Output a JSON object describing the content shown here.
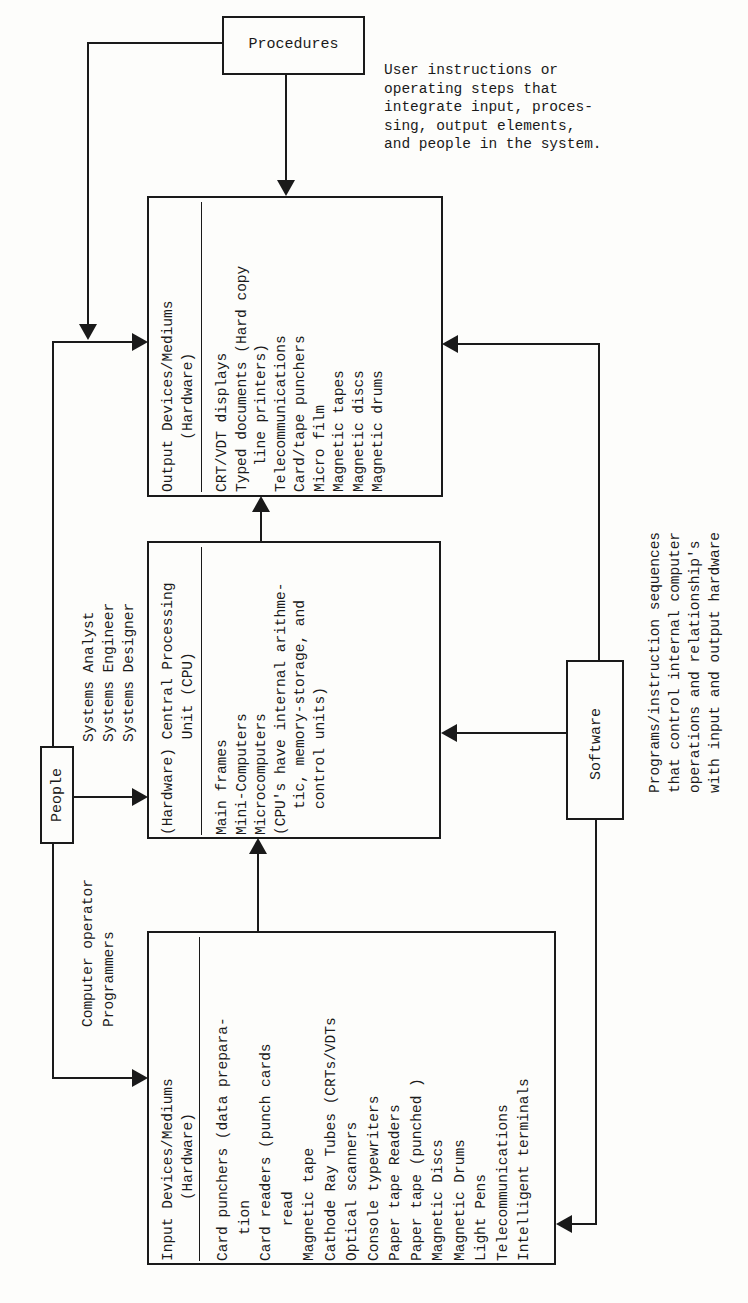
{
  "procedures": {
    "label": "Procedures",
    "description": "User instructions or\noperating steps that\nintegrate input, proces-\nsing, output elements,\nand people in the system."
  },
  "output_box": {
    "title": "Output Devices/Mediums\n      (Hardware)",
    "items": "CRT/VDT displays\nTyped documents (Hard copy\n   line printers)\nTelecommunications\nCard/tape punchers\nMicro film\nMagnetic tapes\nMagnetic discs\nMagnetic drums"
  },
  "cpu_box": {
    "title": "(Hardware) Central Processing\n           Unit (CPU)",
    "items": "Main frames\nMini-Computers\nMicrocomputers\n(CPU's have internal arithme-\n   tic, memory-storage, and\n   control units)"
  },
  "input_box": {
    "title": "Input Devices/Mediums\n       (Hardware)",
    "items": "Card punchers (data prepara-\n   tion\nCard readers (punch cards\n    read\nMagnetic tape\nCathode Ray Tubes (CRTs/VDTs\nOptical scanners\nConsole typewriters\nPaper tape Readers\nPaper tape (punched )\nMagnetic Discs\nMagnetic Drums\nLight Pens\nTelecommunications\nIntelligent terminals"
  },
  "people": {
    "label": "People",
    "upper_roles": "Systems Analyst\nSystems Engineer\nSystems Designer",
    "lower_roles": "Computer operator\nProgrammers"
  },
  "software": {
    "label": "Software",
    "description": "Programs/instruction sequences\nthat control internal computer\noperations and relationship's\nwith input and output hardware"
  }
}
